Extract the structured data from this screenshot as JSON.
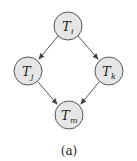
{
  "diagram": {
    "caption": "(a)",
    "nodes": [
      {
        "id": "Ti",
        "base": "T",
        "sub": "i",
        "cx": 68,
        "cy": 26
      },
      {
        "id": "Tj",
        "base": "T",
        "sub": "j",
        "cx": 28,
        "cy": 71
      },
      {
        "id": "Tk",
        "base": "T",
        "sub": "k",
        "cx": 109,
        "cy": 71
      },
      {
        "id": "Tm",
        "base": "T",
        "sub": "m",
        "cx": 69,
        "cy": 115
      }
    ],
    "edges": [
      {
        "from": "Ti",
        "to": "Tj"
      },
      {
        "from": "Ti",
        "to": "Tk"
      },
      {
        "from": "Tj",
        "to": "Tm"
      },
      {
        "from": "Tk",
        "to": "Tm"
      }
    ],
    "colors": {
      "node_fill": "#e6e6e6",
      "node_stroke": "#555555",
      "edge": "#444444"
    }
  }
}
